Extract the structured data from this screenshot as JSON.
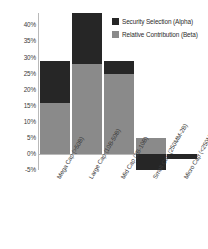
{
  "chart_data": {
    "type": "bar",
    "subtype": "stacked-bar-with-negative",
    "title": "",
    "xlabel": "",
    "ylabel": "",
    "ylim": [
      -5,
      44
    ],
    "grid": false,
    "legend_position": "top-right",
    "y_tick_labels": [
      "40%",
      "35%",
      "30%",
      "25%",
      "20%",
      "15%",
      "10%",
      "5%",
      "0%",
      "-5%"
    ],
    "y_tick_values": [
      40,
      35,
      30,
      25,
      20,
      15,
      10,
      5,
      0,
      -5
    ],
    "categories": [
      "Mega Cap (>50B)",
      "Large Cap (10B-50B)",
      "Mid Cap (2B-10B)",
      "Small Cap (250MM-2B)",
      "Micro Cap (<250MM)"
    ],
    "series": [
      {
        "name": "Security Selection (Alpha)",
        "color": "#262626",
        "values": [
          13,
          16,
          4,
          -5,
          -1.5
        ]
      },
      {
        "name": "Relative Contribution (Beta)",
        "color": "#8a8a8a",
        "values": [
          16,
          28,
          25,
          5,
          0
        ]
      }
    ],
    "totals": [
      29,
      44,
      29,
      0,
      -1.5
    ]
  },
  "legend": {
    "items": [
      {
        "label": "Security Selection (Alpha)",
        "color": "#262626"
      },
      {
        "label": "Relative Contribution (Beta)",
        "color": "#8a8a8a"
      }
    ]
  },
  "axis": {
    "colors": {
      "axis_line": "#b9b9b9",
      "tick_text": "#3a3a3a"
    }
  }
}
